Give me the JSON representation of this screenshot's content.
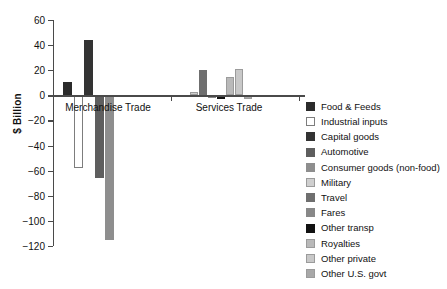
{
  "chart_data": {
    "type": "bar",
    "title": "",
    "subtitle": "",
    "xlabel": "",
    "ylabel": "$ Billion",
    "ylim": [
      -120,
      60
    ],
    "yticks": [
      60,
      40,
      20,
      0,
      -20,
      -40,
      -60,
      -80,
      -100,
      -120
    ],
    "ytick_labels": [
      "60",
      "40",
      "20",
      "0",
      "−20",
      "−40",
      "−60",
      "−80",
      "−100",
      "−120"
    ],
    "grid": false,
    "legend_position": "right",
    "categories": [
      "Merchandise Trade",
      "Services Trade"
    ],
    "groups": [
      {
        "name": "Merchandise Trade",
        "bars": [
          {
            "series": "Food & Feeds",
            "value": 11
          },
          {
            "series": "Industrial inputs",
            "value": -58
          },
          {
            "series": "Capital goods",
            "value": 44
          },
          {
            "series": "Automotive",
            "value": -66
          },
          {
            "series": "Consumer goods (non-food)",
            "value": -115
          }
        ]
      },
      {
        "name": "Services Trade",
        "bars": [
          {
            "series": "Military",
            "value": 3
          },
          {
            "series": "Travel",
            "value": 20
          },
          {
            "series": "Fares",
            "value": -2
          },
          {
            "series": "Other transp",
            "value": -3
          },
          {
            "series": "Royalties",
            "value": 15
          },
          {
            "series": "Other private",
            "value": 21
          },
          {
            "series": "Other U.S. govt",
            "value": -3
          }
        ]
      }
    ],
    "series": [
      {
        "name": "Food & Feeds",
        "color": "#2b2b2b",
        "border": "#2b2b2b"
      },
      {
        "name": "Industrial inputs",
        "color": "#ffffff",
        "border": "#7d7d7d"
      },
      {
        "name": "Capital goods",
        "color": "#333333",
        "border": "#333333"
      },
      {
        "name": "Automotive",
        "color": "#5e5e5e",
        "border": "#5e5e5e"
      },
      {
        "name": "Consumer goods (non-food)",
        "color": "#8e8e8e",
        "border": "#8e8e8e"
      },
      {
        "name": "Military",
        "color": "#cfcfcf",
        "border": "#9b9b9b"
      },
      {
        "name": "Travel",
        "color": "#6f6f6f",
        "border": "#6f6f6f"
      },
      {
        "name": "Fares",
        "color": "#888888",
        "border": "#888888"
      },
      {
        "name": "Other transp",
        "color": "#121212",
        "border": "#121212"
      },
      {
        "name": "Royalties",
        "color": "#b9b9b9",
        "border": "#9b9b9b"
      },
      {
        "name": "Other private",
        "color": "#c8c8c8",
        "border": "#9b9b9b"
      },
      {
        "name": "Other U.S. govt",
        "color": "#a8a8a8",
        "border": "#9b9b9b"
      }
    ]
  },
  "axis": {
    "y_title": "$ Billion",
    "tick_0": "60",
    "tick_1": "40",
    "tick_2": "20",
    "tick_3": "0",
    "tick_4": "−20",
    "tick_5": "−40",
    "tick_6": "−60",
    "tick_7": "−80",
    "tick_8": "−100",
    "tick_9": "−120"
  },
  "group_labels": {
    "merchandise": "Merchandise Trade",
    "services": "Services Trade"
  },
  "legend": {
    "items": [
      {
        "label": "Food & Feeds"
      },
      {
        "label": "Industrial inputs"
      },
      {
        "label": "Capital goods"
      },
      {
        "label": "Automotive"
      },
      {
        "label": "Consumer goods (non-food)"
      },
      {
        "label": "Military"
      },
      {
        "label": "Travel"
      },
      {
        "label": "Fares"
      },
      {
        "label": "Other transp"
      },
      {
        "label": "Royalties"
      },
      {
        "label": "Other private"
      },
      {
        "label": "Other U.S. govt"
      }
    ]
  }
}
